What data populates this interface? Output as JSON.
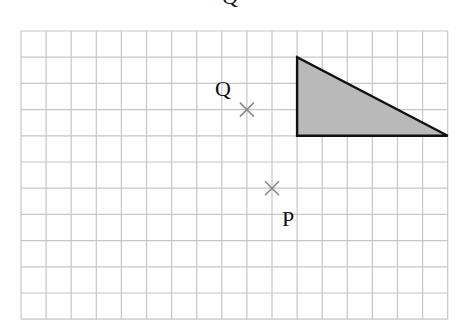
{
  "diagram": {
    "type": "grid-transformation",
    "grid": {
      "origin_px": [
        21,
        31
      ],
      "cell_w": 25.1,
      "cell_h": 26.2,
      "cols": 17,
      "rows": 11,
      "line_color": "#c6c6c6",
      "border_color": "#bdbdbd"
    },
    "shape": {
      "name": "triangle",
      "vertices": [
        [
          11,
          1
        ],
        [
          11,
          4
        ],
        [
          17,
          4
        ]
      ],
      "fill": "#b9b9b9",
      "stroke": "#111111"
    },
    "points": [
      {
        "name": "Q",
        "label": "Q",
        "grid": [
          9,
          3
        ],
        "label_offset": [
          -24,
          -14
        ]
      },
      {
        "name": "P",
        "label": "P",
        "grid": [
          10,
          6
        ],
        "label_offset": [
          16,
          38
        ]
      }
    ],
    "cross_color": "#8a8a8a",
    "clipped_top_glyph": "Q"
  }
}
